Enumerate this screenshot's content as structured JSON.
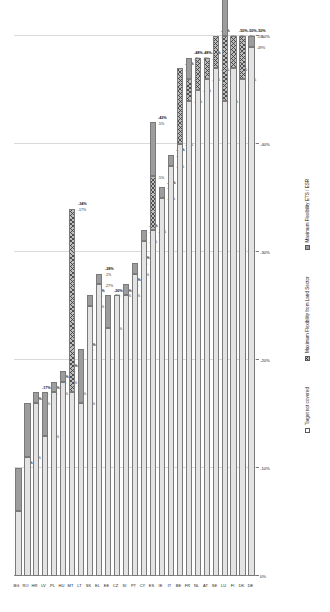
{
  "chart_data": {
    "type": "bar",
    "orientation": "horizontal-stacked",
    "title": "",
    "xlabel": "",
    "ylabel": "",
    "xlim": [
      0,
      -50
    ],
    "xticks": [
      "0%",
      "-10%",
      "-20%",
      "-30%",
      "-40%",
      "-50%"
    ],
    "xtick_values": [
      0,
      -10,
      -20,
      -30,
      -40,
      -50
    ],
    "grid": true,
    "legend_position": "bottom",
    "categories": [
      "BG",
      "RO",
      "HR",
      "LV",
      "PL",
      "HU",
      "MT",
      "LT",
      "SK",
      "EL",
      "EE",
      "CZ",
      "SI",
      "PT",
      "CY",
      "ES",
      "IE",
      "IT",
      "BE",
      "FR",
      "NL",
      "AT",
      "SE",
      "LU",
      "FI",
      "DK",
      "DE"
    ],
    "series": [
      {
        "name": "Target not covered",
        "key": "not_covered",
        "values": [
          -6,
          -11,
          -16,
          -13,
          -17,
          -18,
          -17,
          -16,
          -25,
          -27,
          -23,
          -26,
          -26,
          -28,
          -31,
          -32,
          -35,
          -38,
          -40,
          -44,
          -45,
          -46,
          -47,
          -44,
          -47,
          -46,
          -49
        ]
      },
      {
        "name": "Maximum Flexibility from Land Sector",
        "key": "flex_land",
        "values": [
          0,
          0,
          0,
          0,
          0,
          0,
          -17,
          0,
          0,
          0,
          0,
          0,
          0,
          0,
          0,
          -5,
          0,
          0,
          -7,
          -2,
          -3,
          -2,
          -3,
          -6,
          -3,
          -4,
          0
        ]
      },
      {
        "name": "Maximum Flexibility ETS / ESR",
        "key": "flex_ets",
        "values": [
          -4,
          -5,
          -1,
          -4,
          -1,
          -1,
          0,
          -5,
          -1,
          -1,
          -3,
          0,
          -1,
          -1,
          -1,
          -5,
          -1,
          -1,
          0,
          -2,
          0,
          0,
          0,
          -5,
          0,
          0,
          -1
        ]
      }
    ],
    "totals": [
      "-10%",
      "-16%",
      "-17%",
      "-17%",
      "-18%",
      "-19%",
      "-34%",
      "-21%",
      "-26%",
      "-28%",
      "-26%",
      "-26%",
      "-27%",
      "-29%",
      "-32%",
      "-42%",
      "-36%",
      "-39%",
      "-47%",
      "-48%",
      "-48%",
      "-48%",
      "-50%",
      "-55%",
      "-50%",
      "-50%",
      "-50%"
    ],
    "data_labels": {
      "not_covered": [
        "-6%",
        "-11%",
        "-16%",
        "-13%",
        "-17%",
        "-18%",
        "-17%",
        "-16%",
        "-25%",
        "-27%",
        "-23%",
        "-26%",
        "-26%",
        "-28%",
        "-31%",
        "-32%",
        "-35%",
        "-38%",
        "-40%",
        "-44%",
        "-45%",
        "-46%",
        "-47%",
        "-44%",
        "-47%",
        "-46%",
        "-49%"
      ],
      "flex_land": [
        "",
        "",
        "",
        "",
        "",
        "",
        "-17%",
        "",
        "",
        "",
        "",
        "",
        "",
        "",
        "",
        "-5%",
        "",
        "",
        "-7%",
        "-2%",
        "-3%",
        "-2%",
        "-3%",
        "-6%",
        "-3%",
        "-4%",
        ""
      ],
      "flex_ets": [
        "-4%",
        "-5%",
        "-1%",
        "-4%",
        "-1%",
        "-1%",
        "",
        "-5%",
        "-1%",
        "-1%",
        "-3%",
        "",
        "-1%",
        "-1%",
        "-1%",
        "-5%",
        "-1%",
        "-1%",
        "",
        "-2%",
        "",
        "",
        "",
        "-5%",
        "",
        "",
        "-1%"
      ]
    }
  },
  "legend": {
    "items": [
      {
        "label": "Target not covered",
        "swatch": "not-covered"
      },
      {
        "label": "Maximum Flexibility from Land Sector",
        "swatch": "flex-land"
      },
      {
        "label": "Maximum Flexibility ETS / ESR",
        "swatch": "flex-ets"
      }
    ]
  },
  "colors": {
    "not_covered": "#e3e3e3",
    "flex_land": "#bdbdbd",
    "flex_ets": "#9d9d9d",
    "grid": "#d9d9d9",
    "axis": "#7a7a7a",
    "text": "#1a1a1a"
  }
}
